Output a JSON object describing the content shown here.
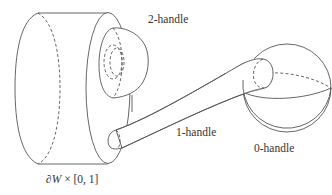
{
  "diagram": {
    "type": "handle-decomposition",
    "labels": {
      "two_handle": "2-handle",
      "one_handle": "1-handle",
      "zero_handle": "0-handle",
      "collar_prefix": "∂",
      "collar_var": "W",
      "collar_suffix": " × [0, 1]"
    },
    "components": [
      {
        "name": "collar-cylinder",
        "label": "∂W × [0, 1]"
      },
      {
        "name": "2-handle",
        "label": "2-handle"
      },
      {
        "name": "1-handle",
        "label": "1-handle"
      },
      {
        "name": "0-handle",
        "label": "0-handle"
      }
    ],
    "colors": {
      "stroke": "#555555",
      "text": "#333333",
      "background": "#ffffff"
    }
  }
}
